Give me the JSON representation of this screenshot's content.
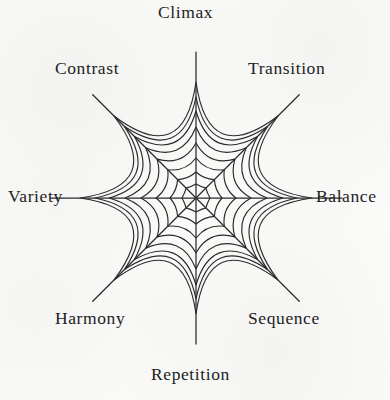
{
  "diagram": {
    "type": "radar-web",
    "background_color": "#fbfbfa",
    "ink_color": "#2b2b2b",
    "center": {
      "x": 196,
      "y": 198
    },
    "ring_count": 8,
    "spoke_count": 8,
    "outer_radius": 116,
    "ring_radii": [
      14,
      26,
      40,
      55,
      71,
      87,
      101,
      116
    ],
    "spoke_overshoot": 30,
    "axes": [
      {
        "id": "climax",
        "label": "Climax",
        "angle_deg": 90,
        "label_x": 158,
        "label_y": 4,
        "label_align": "left"
      },
      {
        "id": "transition",
        "label": "Transition",
        "angle_deg": 45,
        "label_x": 248,
        "label_y": 60,
        "label_align": "left"
      },
      {
        "id": "balance",
        "label": "Balance",
        "angle_deg": 0,
        "label_x": 316,
        "label_y": 188,
        "label_align": "left"
      },
      {
        "id": "sequence",
        "label": "Sequence",
        "angle_deg": 315,
        "label_x": 248,
        "label_y": 310,
        "label_align": "left"
      },
      {
        "id": "repetition",
        "label": "Repetition",
        "angle_deg": 270,
        "label_x": 151,
        "label_y": 366,
        "label_align": "left"
      },
      {
        "id": "harmony",
        "label": "Harmony",
        "angle_deg": 225,
        "label_x": 55,
        "label_y": 310,
        "label_align": "left"
      },
      {
        "id": "variety",
        "label": "Variety",
        "angle_deg": 180,
        "label_x": 8,
        "label_y": 188,
        "label_align": "left"
      },
      {
        "id": "contrast",
        "label": "Contrast",
        "angle_deg": 135,
        "label_x": 55,
        "label_y": 60,
        "label_align": "left"
      }
    ]
  },
  "chart_data": {
    "type": "radar",
    "title": "",
    "categories": [
      "Climax",
      "Transition",
      "Balance",
      "Sequence",
      "Repetition",
      "Harmony",
      "Variety",
      "Contrast"
    ],
    "rings": 8,
    "ring_values": [
      1,
      2,
      3,
      4,
      5,
      6,
      7,
      8
    ],
    "series": [],
    "grid": true,
    "legend": "none"
  }
}
